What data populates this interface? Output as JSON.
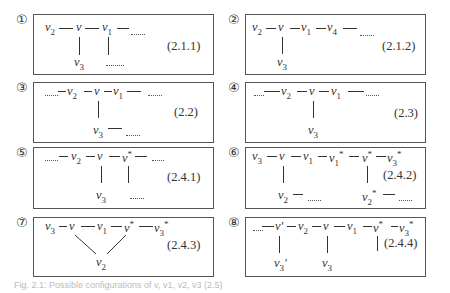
{
  "panels": [
    {
      "number": "①",
      "equation": "(2.1.1)",
      "nodes": [
        "v2",
        "v",
        "v1",
        "v3"
      ],
      "edges": [
        [
          "v2",
          "v"
        ],
        [
          "v",
          "v1"
        ],
        [
          "v1",
          "..."
        ],
        [
          "v",
          "v3"
        ],
        [
          "v1",
          "..."
        ]
      ]
    },
    {
      "number": "②",
      "equation": "(2.1.2)",
      "nodes": [
        "v2",
        "v",
        "v1",
        "v4",
        "v3"
      ],
      "edges": [
        [
          "v2",
          "v"
        ],
        [
          "v",
          "v1"
        ],
        [
          "v1",
          "v4"
        ],
        [
          "v4",
          "..."
        ],
        [
          "v",
          "v3"
        ]
      ]
    },
    {
      "number": "③",
      "equation": "(2.2)",
      "nodes": [
        "v2",
        "v",
        "v1",
        "v3"
      ],
      "edges": [
        [
          "...",
          "v2"
        ],
        [
          "v2",
          "v"
        ],
        [
          "v",
          "v1"
        ],
        [
          "v1",
          "..."
        ],
        [
          "v",
          "v3"
        ],
        [
          "v3",
          "..."
        ]
      ]
    },
    {
      "number": "④",
      "equation": "(2.3)",
      "nodes": [
        "v2",
        "v",
        "v1",
        "v3"
      ],
      "edges": [
        [
          "...",
          "v2"
        ],
        [
          "v2",
          "v"
        ],
        [
          "v",
          "v1"
        ],
        [
          "v1",
          "..."
        ],
        [
          "v",
          "v3"
        ]
      ]
    },
    {
      "number": "⑤",
      "equation": "(2.4.1)",
      "nodes": [
        "v2",
        "v",
        "v*",
        "v3"
      ],
      "edges": [
        [
          "...",
          "v2"
        ],
        [
          "v2",
          "v"
        ],
        [
          "v",
          "v*"
        ],
        [
          "v*",
          "..."
        ],
        [
          "v",
          "v3"
        ],
        [
          "v*",
          "..."
        ]
      ]
    },
    {
      "number": "⑥",
      "equation": "(2.4.2)",
      "nodes": [
        "v3",
        "v",
        "v1",
        "v1*",
        "v*",
        "v3*",
        "v2",
        "v2*"
      ],
      "edges": [
        [
          "v3",
          "v"
        ],
        [
          "v",
          "v1"
        ],
        [
          "v1",
          "v1*"
        ],
        [
          "v1*",
          "v*"
        ],
        [
          "v*",
          "v3*"
        ],
        [
          "v",
          "v2"
        ],
        [
          "v2",
          "..."
        ],
        [
          "v*",
          "v2*"
        ],
        [
          "v2*",
          "..."
        ]
      ]
    },
    {
      "number": "⑦",
      "equation": "(2.4.3)",
      "nodes": [
        "v3",
        "v",
        "v1",
        "v*",
        "v3*",
        "v2"
      ],
      "edges": [
        [
          "v3",
          "v"
        ],
        [
          "v",
          "v1"
        ],
        [
          "v1",
          "v*"
        ],
        [
          "v*",
          "v3*"
        ],
        [
          "v",
          "v2"
        ],
        [
          "v*",
          "v2"
        ]
      ]
    },
    {
      "number": "⑧",
      "equation": "(2.4.4)",
      "nodes": [
        "v'",
        "v2",
        "v",
        "v1",
        "v*",
        "v3*",
        "v3'",
        "v3"
      ],
      "edges": [
        [
          "...",
          "v'"
        ],
        [
          "v'",
          "v2"
        ],
        [
          "v2",
          "v"
        ],
        [
          "v",
          "v1"
        ],
        [
          "v1",
          "v*"
        ],
        [
          "v*",
          "v3*"
        ],
        [
          "v'",
          "v3'"
        ],
        [
          "v",
          "v3"
        ],
        [
          "v*",
          "..."
        ]
      ]
    }
  ],
  "caption": "Fig. 2.1: Possible configurations of v, v1, v2, v3 (2.5)"
}
